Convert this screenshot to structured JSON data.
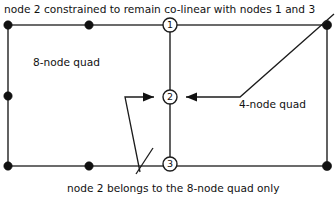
{
  "figure": {
    "title_note_top": "node 2 constrained to remain co-linear with nodes 1 and 3",
    "note_bottom": "node 2 belongs to the 8-node quad only",
    "labels": {
      "left_region": "8-node quad",
      "right_region": "4-node quad"
    },
    "node_numbers": {
      "node1": "1",
      "node2": "2",
      "node3": "3"
    },
    "colors": {
      "mesh_line": "#3a3a3a",
      "leader_line": "#1c1c1c",
      "node_fill": "#111111",
      "ring_fill": "#ffffff",
      "text": "#111111",
      "background": "#ffffff"
    },
    "geometry": {
      "outer_rect": {
        "x": 8,
        "y": 25,
        "width": 319,
        "height": 141
      },
      "divider_x": 170,
      "corner_nodes": [
        {
          "name": "top-left-corner-node",
          "x": 8,
          "y": 25
        },
        {
          "name": "top-mid-side-node",
          "x": 89,
          "y": 25
        },
        {
          "name": "left-mid-side-node",
          "x": 8,
          "y": 96
        },
        {
          "name": "bottom-left-corner-node",
          "x": 8,
          "y": 166
        },
        {
          "name": "bottom-mid-side-node",
          "x": 89,
          "y": 166
        },
        {
          "name": "top-right-corner-node",
          "x": 327,
          "y": 25
        },
        {
          "name": "bottom-right-corner-node",
          "x": 327,
          "y": 166
        }
      ],
      "ring_nodes": [
        {
          "name": "node-1",
          "x": 170,
          "y": 25,
          "r": 7
        },
        {
          "name": "node-2",
          "x": 170,
          "y": 97,
          "r": 7
        },
        {
          "name": "node-3",
          "x": 170,
          "y": 164,
          "r": 7
        }
      ]
    }
  }
}
